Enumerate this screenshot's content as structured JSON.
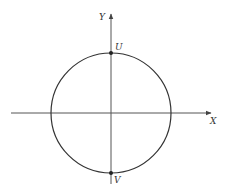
{
  "diagram": {
    "type": "circle-on-axes",
    "axes": {
      "x_label": "X",
      "y_label": "Y",
      "origin": [
        111,
        113
      ],
      "x_range": [
        11,
        211
      ],
      "y_range": [
        184,
        14
      ]
    },
    "circle": {
      "center": [
        111,
        113
      ],
      "radius": 60,
      "stroke": "#333333"
    },
    "points": [
      {
        "name": "U",
        "label": "U",
        "position": "top",
        "x": 111,
        "y": 53
      },
      {
        "name": "V",
        "label": "V",
        "position": "bottom",
        "x": 111,
        "y": 173
      }
    ],
    "colors": {
      "line": "#333333",
      "axis": "#555555",
      "background": "#ffffff"
    }
  }
}
